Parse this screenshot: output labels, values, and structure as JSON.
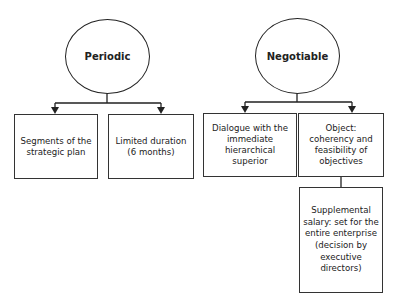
{
  "diagram": {
    "nodes": {
      "periodic": {
        "label": "Periodic",
        "shape": "circle"
      },
      "negotiable": {
        "label": "Negotiable",
        "shape": "circle"
      },
      "segments": {
        "label": "Segments of the strategic plan",
        "shape": "box",
        "parent": "periodic"
      },
      "limited": {
        "label": "Limited duration (6 months)",
        "shape": "box",
        "parent": "periodic"
      },
      "dialogue": {
        "label": "Dialogue with the immediate hierarchical superior",
        "shape": "box",
        "parent": "negotiable"
      },
      "object": {
        "label": "Object: coherency and feasibility of objectives",
        "shape": "box",
        "parent": "negotiable"
      },
      "supplemental": {
        "label": "Supplemental salary: set for the entire enterprise (decision by executive directors)",
        "shape": "box",
        "parent": "object"
      }
    },
    "edges": [
      {
        "from": "periodic",
        "to": "segments",
        "arrow": true
      },
      {
        "from": "periodic",
        "to": "limited",
        "arrow": true
      },
      {
        "from": "negotiable",
        "to": "dialogue",
        "arrow": true
      },
      {
        "from": "negotiable",
        "to": "object",
        "arrow": true
      },
      {
        "from": "object",
        "to": "supplemental",
        "arrow": false
      }
    ],
    "colors": {
      "stroke": "#222222",
      "background": "#ffffff"
    }
  }
}
